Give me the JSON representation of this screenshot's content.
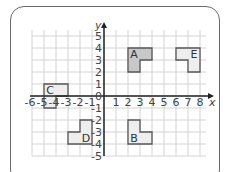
{
  "figure": {
    "x_axis_label": "x",
    "y_axis_label": "y",
    "x_ticks": [
      "-6",
      "-5",
      "-4",
      "-3",
      "-2",
      "-1",
      "1",
      "2",
      "3",
      "4",
      "5",
      "6",
      "7",
      "8"
    ],
    "y_ticks": [
      "5",
      "4",
      "3",
      "2",
      "1",
      "0",
      "-1",
      "-2",
      "-3",
      "-4",
      "-5"
    ],
    "origin_label": "0",
    "shapes": [
      {
        "label": "A",
        "points": [
          [
            2,
            4
          ],
          [
            4,
            4
          ],
          [
            4,
            3
          ],
          [
            3,
            3
          ],
          [
            3,
            2
          ],
          [
            2,
            2
          ]
        ],
        "label_at": [
          2.5,
          3.5
        ],
        "shade": "#c8c8c8"
      },
      {
        "label": "B",
        "points": [
          [
            2,
            -2
          ],
          [
            3,
            -2
          ],
          [
            3,
            -3
          ],
          [
            4,
            -3
          ],
          [
            4,
            -4
          ],
          [
            2,
            -4
          ]
        ],
        "label_at": [
          2.5,
          -3.5
        ],
        "shade": "#eeeeee"
      },
      {
        "label": "C",
        "points": [
          [
            -5,
            1
          ],
          [
            -3,
            1
          ],
          [
            -3,
            0
          ],
          [
            -4,
            0
          ],
          [
            -4,
            -1
          ],
          [
            -5,
            -1
          ]
        ],
        "label_at": [
          -4.5,
          0.5
        ],
        "shade": "#eeeeee"
      },
      {
        "label": "D",
        "points": [
          [
            -2,
            -2
          ],
          [
            -1,
            -2
          ],
          [
            -1,
            -4
          ],
          [
            -3,
            -4
          ],
          [
            -3,
            -3
          ],
          [
            -2,
            -3
          ]
        ],
        "label_at": [
          -1.5,
          -3.5
        ],
        "shade": "#eeeeee"
      },
      {
        "label": "E",
        "points": [
          [
            6,
            4
          ],
          [
            8,
            4
          ],
          [
            8,
            2
          ],
          [
            7,
            2
          ],
          [
            7,
            3
          ],
          [
            6,
            3
          ]
        ],
        "label_at": [
          7.5,
          3.5
        ],
        "shade": "#eeeeee"
      }
    ]
  }
}
